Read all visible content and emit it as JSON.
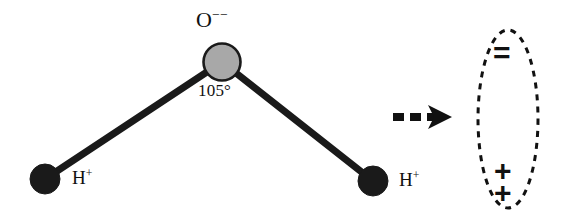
{
  "diagram": {
    "background_color": "#ffffff",
    "ink_color": "#111111"
  },
  "molecule": {
    "name": "water",
    "formula": "H2O",
    "bond_angle_label": "105°",
    "bond_angle_value": 105,
    "atoms": [
      {
        "id": "oxygen",
        "element_label": "O",
        "charge_label": "−−",
        "charge_value": -2,
        "full_label": "O−−",
        "fill_color": "#a8a8a8",
        "stroke_color": "#1a1a1a",
        "center_x": 222,
        "center_y": 62,
        "radius": 19
      },
      {
        "id": "hydrogen-left",
        "element_label": "H",
        "charge_label": "+",
        "charge_value": 1,
        "full_label": "H+",
        "fill_color": "#1a1a1a",
        "stroke_color": "#1a1a1a",
        "center_x": 45,
        "center_y": 179,
        "radius": 15
      },
      {
        "id": "hydrogen-right",
        "element_label": "H",
        "charge_label": "+",
        "charge_value": 1,
        "full_label": "H+",
        "fill_color": "#1a1a1a",
        "stroke_color": "#1a1a1a",
        "center_x": 373,
        "center_y": 181,
        "radius": 15
      }
    ],
    "bonds": [
      {
        "id": "bond-o-h-left",
        "from": "oxygen",
        "to": "hydrogen-left",
        "width": 7,
        "color": "#1a1a1a"
      },
      {
        "id": "bond-o-h-right",
        "from": "oxygen",
        "to": "hydrogen-right",
        "width": 7,
        "color": "#1a1a1a"
      }
    ]
  },
  "arrow": {
    "id": "implication-arrow",
    "style": "dashed",
    "direction": "right",
    "color": "#111111",
    "start_x": 391,
    "end_x": 448,
    "y": 117
  },
  "dipole": {
    "id": "net-dipole-ellipse",
    "outline_style": "dashed",
    "outline_color": "#111111",
    "center_x": 508,
    "center_y": 119,
    "radius_x": 30,
    "radius_y": 89,
    "negative_symbol": "=",
    "negative_charge_count": 2,
    "positive_symbol_1": "+",
    "positive_symbol_2": "+",
    "positive_charge_count": 2
  }
}
